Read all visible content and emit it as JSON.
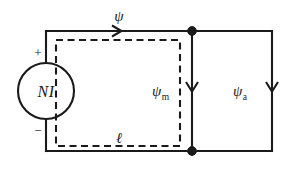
{
  "diagram": {
    "background_color": "#ffffff",
    "line_color": "#1a1a1a",
    "source": {
      "label": "NI",
      "plus_sign": "+",
      "minus_sign": "−",
      "shape": "circle",
      "cx": 46,
      "cy": 91,
      "r": 28
    },
    "labels": {
      "total_flux": "ψ",
      "core_flux_base": "ψ",
      "core_flux_subscript": "m",
      "air_flux_base": "ψ",
      "air_flux_subscript": "a",
      "mean_path": "ℓ"
    },
    "arrows": [
      {
        "name": "top-flux-arrow",
        "direction": "right",
        "x": 120,
        "y": 31
      },
      {
        "name": "middle-branch-arrow",
        "direction": "down",
        "x": 192,
        "y": 91
      },
      {
        "name": "right-branch-arrow",
        "direction": "down",
        "x": 272,
        "y": 91
      }
    ],
    "nodes": [
      {
        "name": "top-junction",
        "x": 192,
        "y": 31
      },
      {
        "name": "bottom-junction",
        "x": 192,
        "y": 151
      }
    ],
    "outer_loop": {
      "left": 46,
      "right": 272,
      "top": 31,
      "bottom": 151
    },
    "dashed_loop": {
      "left": 56,
      "right": 180,
      "top": 40,
      "bottom": 146
    }
  }
}
